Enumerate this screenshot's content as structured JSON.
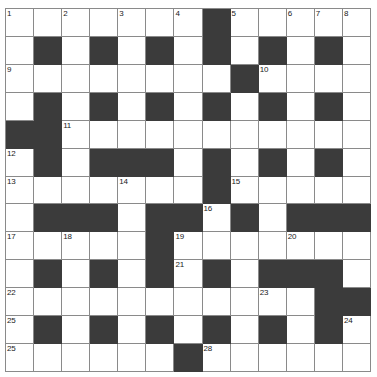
{
  "puzzle": {
    "title": "Crossword Grid",
    "type": "crossword",
    "columns": 13,
    "rows": 13,
    "colors": {
      "block": "#3b3b3b",
      "cell": "#ffffff",
      "gridline": "#8a8a8a",
      "number": "#1a1a1a",
      "page_background": "#ffffff"
    },
    "layout_key": {
      "white": ".",
      "black": "#"
    },
    "grid": [
      ".......#.....",
      ".#.#.#.#.#.#.",
      "........#....",
      ".#.#.#.#.#.#.",
      "##...........",
      ".#.###.#.#.#.",
      ".......#.....",
      ".###.##.#.###",
      ".....#.......",
      ".#.#.#.#.###.",
      "...........##",
      ".#.#.#.#.#.#.",
      "......#......"
    ],
    "numbers": [
      {
        "n": 1,
        "row": 1,
        "col": 1
      },
      {
        "n": 2,
        "row": 1,
        "col": 3
      },
      {
        "n": 3,
        "row": 1,
        "col": 5
      },
      {
        "n": 4,
        "row": 1,
        "col": 7
      },
      {
        "n": 5,
        "row": 1,
        "col": 9
      },
      {
        "n": 6,
        "row": 1,
        "col": 11
      },
      {
        "n": 7,
        "row": 1,
        "col": 13
      },
      {
        "n": 8,
        "row": 1,
        "col": 13
      },
      {
        "n": 9,
        "row": 3,
        "col": 1
      },
      {
        "n": 10,
        "row": 3,
        "col": 10
      },
      {
        "n": 11,
        "row": 5,
        "col": 3
      },
      {
        "n": 12,
        "row": 6,
        "col": 1
      },
      {
        "n": 13,
        "row": 7,
        "col": 1
      },
      {
        "n": 14,
        "row": 7,
        "col": 5
      },
      {
        "n": 15,
        "row": 7,
        "col": 9
      },
      {
        "n": 16,
        "row": 8,
        "col": 8
      },
      {
        "n": 17,
        "row": 9,
        "col": 1
      },
      {
        "n": 18,
        "row": 9,
        "col": 3
      },
      {
        "n": 19,
        "row": 9,
        "col": 7
      },
      {
        "n": 20,
        "row": 9,
        "col": 11
      },
      {
        "n": 21,
        "row": 10,
        "col": 7
      },
      {
        "n": 22,
        "row": 11,
        "col": 1
      },
      {
        "n": 23,
        "row": 11,
        "col": 10
      },
      {
        "n": 24,
        "row": 12,
        "col": 13
      },
      {
        "n": 25,
        "row": 13,
        "col": 1
      },
      {
        "n": 26,
        "row": 13,
        "col": 7
      },
      {
        "n": 27,
        "row": 13,
        "col": 1
      },
      {
        "n": 28,
        "row": 13,
        "col": 8
      }
    ],
    "numbered_cells": {
      "r1c1": "1",
      "r1c3": "2",
      "r1c5": "3",
      "r1c7": "4",
      "r1c9": "5",
      "r1c11": "6",
      "r1c13": "8",
      "r1c12": "7",
      "r3c1": "9",
      "r3c10": "10",
      "r5c3": "11",
      "r6c1": "12",
      "r7c1": "13",
      "r7c5": "14",
      "r7c9": "15",
      "r8c8": "16",
      "r9c1": "17",
      "r9c3": "18",
      "r9c7": "19",
      "r9c11": "20",
      "r10c7": "21",
      "r11c1": "22",
      "r11c10": "23",
      "r12c13": "24",
      "r13c1": "25",
      "r13c7": "26"
    },
    "extra_numbered_cells": {
      "r12c1": "25",
      "r13c1b": "27",
      "r13c8": "28"
    }
  }
}
